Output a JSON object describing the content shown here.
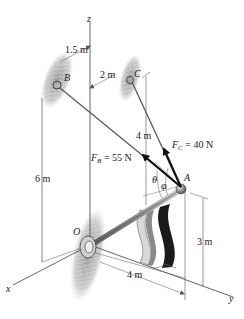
{
  "diagram": {
    "type": "3d-statics-force-diagram",
    "axes": {
      "x": "x",
      "y": "y",
      "z": "z"
    },
    "points": {
      "origin": "O",
      "A": "A",
      "B": "B",
      "C": "C"
    },
    "forces": {
      "FB": {
        "symbol": "F",
        "subscript": "B",
        "value": "= 55 N"
      },
      "FC": {
        "symbol": "F",
        "subscript": "C",
        "value": "= 40 N"
      }
    },
    "angles": {
      "theta": "θ",
      "phi": "φ"
    },
    "dimensions": {
      "b_offset": "1.5 m",
      "c_offset": "2 m",
      "c_height_to_a": "4 m",
      "b_height": "6 m",
      "a_height": "3 m",
      "a_along_y": "4 m"
    },
    "colors": {
      "line": "#555555",
      "force_arrow": "#111111",
      "rod": "#9a9a9a",
      "wall": "#9a9a9a",
      "flag_dark": "#1a1a1a",
      "flag_gray": "#8a8a8a",
      "flag_light": "#d8d8d8"
    }
  }
}
